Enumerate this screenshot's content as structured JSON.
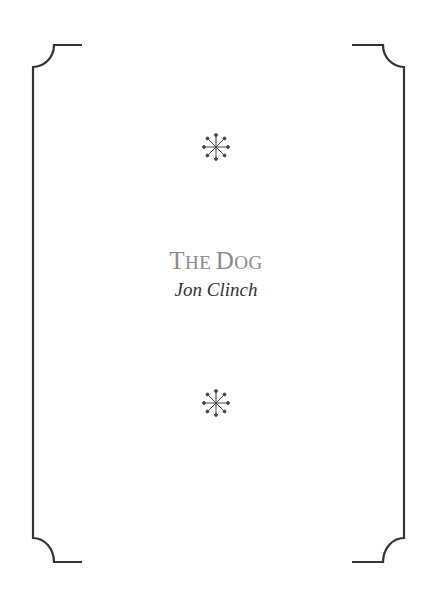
{
  "page": {
    "title_parts": [
      {
        "initial": "T",
        "rest": "HE"
      },
      {
        "initial": "D",
        "rest": "OG"
      }
    ],
    "title_full": "The Dog",
    "author": "Jon Clinch"
  },
  "ornaments": [
    "asterism-star-icon",
    "asterism-star-icon"
  ],
  "colors": {
    "frame": "#333333",
    "title": "#8a8a8a",
    "author": "#333333"
  }
}
